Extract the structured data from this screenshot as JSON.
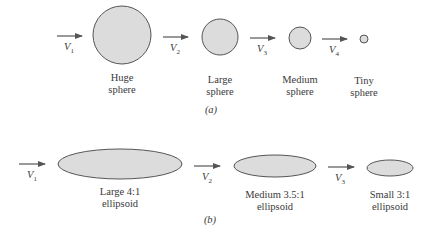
{
  "figure": {
    "colors": {
      "fill": "#dcdcdc",
      "stroke": "#555555",
      "arrow": "#555555",
      "text": "#3a3a3a"
    },
    "panel_a": {
      "caption": "(a)",
      "arrows": [
        {
          "label": "V",
          "sub": "1"
        },
        {
          "label": "V",
          "sub": "2"
        },
        {
          "label": "V",
          "sub": "3"
        },
        {
          "label": "V",
          "sub": "4"
        }
      ],
      "shapes": [
        {
          "line1": "Huge",
          "line2": "sphere"
        },
        {
          "line1": "Large",
          "line2": "sphere"
        },
        {
          "line1": "Medium",
          "line2": "sphere"
        },
        {
          "line1": "Tiny",
          "line2": "sphere"
        }
      ]
    },
    "panel_b": {
      "caption": "(b)",
      "arrows": [
        {
          "label": "V",
          "sub": "1"
        },
        {
          "label": "V",
          "sub": "2"
        },
        {
          "label": "V",
          "sub": "3"
        }
      ],
      "shapes": [
        {
          "line1": "Large 4:1",
          "line2": "ellipsoid"
        },
        {
          "line1": "Medium 3.5:1",
          "line2": "ellipsoid"
        },
        {
          "line1": "Small 3:1",
          "line2": "ellipsoid"
        }
      ]
    }
  }
}
